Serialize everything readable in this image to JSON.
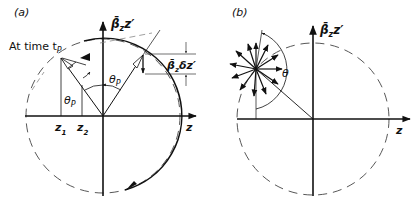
{
  "panels": [
    {
      "id": "a",
      "label": "(a)",
      "vertical_axis_label": "β̄",
      "vertical_axis_sub": "z",
      "vertical_axis_suffix": "z′",
      "horizontal_axis_label": "z",
      "time_label": "At time t",
      "time_sub": "P",
      "angle_label_1": "θ",
      "angle_sub_1": "P",
      "angle_label_2": "θ",
      "angle_sub_2": "P",
      "delta_label_main": "β̄",
      "delta_label_sub": "z",
      "delta_label_suffix": "δz′",
      "z1_label": "z",
      "z1_sub": "1",
      "z2_label": "z",
      "z2_sub": "2"
    },
    {
      "id": "b",
      "label": "(b)",
      "vertical_axis_label": "β̄",
      "vertical_axis_sub": "z",
      "vertical_axis_suffix": "z′",
      "horizontal_axis_label": "z",
      "angle_label": "θ"
    }
  ],
  "colors": {
    "ink": "#111111",
    "dashed": "#444444",
    "background": "#ffffff"
  }
}
